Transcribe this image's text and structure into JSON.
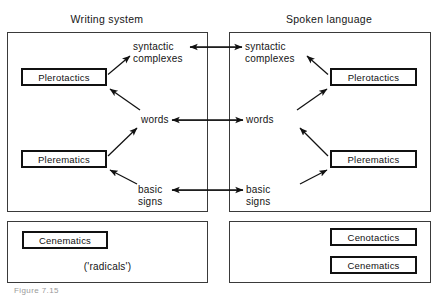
{
  "figure": {
    "caption": "Figure 7.15",
    "headers": {
      "writing_system": "Writing system",
      "spoken_language": "Spoken language"
    },
    "panels": {
      "writing_system_main": {
        "boxes": [
          {
            "id": "ws-plerotactics",
            "label": "Plerotactics"
          },
          {
            "id": "ws-plerematics",
            "label": "Plerematics"
          }
        ],
        "labels": {
          "syntactic_complexes_line1": "syntactic",
          "syntactic_complexes_line2": "complexes",
          "words": "words",
          "basic_signs_line1": "basic",
          "basic_signs_line2": "signs"
        }
      },
      "spoken_language_main": {
        "boxes": [
          {
            "id": "sl-plerotactics",
            "label": "Plerotactics"
          },
          {
            "id": "sl-plerematics",
            "label": "Plerematics"
          }
        ],
        "labels": {
          "syntactic_complexes_line1": "syntactic",
          "syntactic_complexes_line2": "complexes",
          "words": "words",
          "basic_signs_line1": "basic",
          "basic_signs_line2": "signs"
        }
      },
      "writing_system_cenematic": {
        "boxes": [
          {
            "id": "ws-cenematics",
            "label": "Cenematics"
          }
        ],
        "note": "('radicals')"
      },
      "spoken_language_cenematic": {
        "boxes": [
          {
            "id": "sl-cenotactics",
            "label": "Cenotactics"
          },
          {
            "id": "sl-cenematics",
            "label": "Cenematics"
          }
        ]
      }
    },
    "colors": {
      "stroke": "#111111",
      "panel_border": "#3a3a3a",
      "background": "#ffffff",
      "text": "#141414"
    }
  }
}
